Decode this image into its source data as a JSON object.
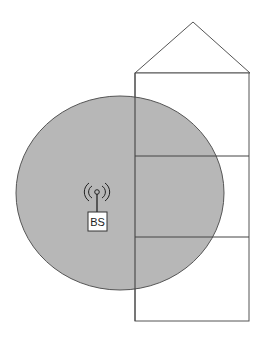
{
  "diagram": {
    "base_station": {
      "label": "BS",
      "icon": "antenna-icon"
    },
    "coverage_area": {
      "fill": "#b3b3b3",
      "stroke": "#555555"
    },
    "building": {
      "floors": 3,
      "stroke": "#555555",
      "roof": "triangle"
    }
  }
}
